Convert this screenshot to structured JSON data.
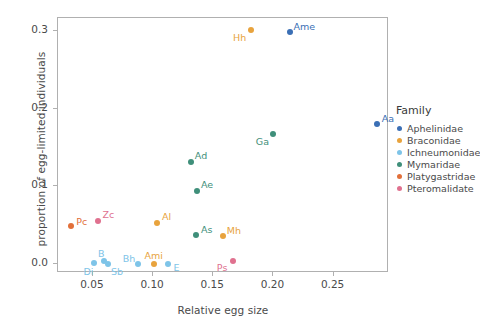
{
  "chart_data": {
    "type": "scatter",
    "title": "",
    "xlabel": "Relative egg size",
    "ylabel": "proportion of egg-limited individuals",
    "xlim": [
      0.021,
      0.296
    ],
    "ylim": [
      -0.012,
      0.317
    ],
    "xticks": [
      "0.05",
      "0.10",
      "0.15",
      "0.20",
      "0.25"
    ],
    "xtick_values": [
      0.05,
      0.1,
      0.15,
      0.2,
      0.25
    ],
    "yticks": [
      "0.0",
      "0.1",
      "0.2",
      "0.3"
    ],
    "ytick_values": [
      0.0,
      0.1,
      0.2,
      0.3
    ],
    "grid": false,
    "legend_position": "right",
    "legend_title": "Family",
    "series": [
      {
        "name": "Aphelinidae",
        "color": "#3b6fb5",
        "points": [
          {
            "label": "Ame",
            "x": 0.214,
            "y": 0.299,
            "label_dx": 14,
            "label_dy": -6
          },
          {
            "label": "Aa",
            "x": 0.286,
            "y": 0.18,
            "label_dx": 11,
            "label_dy": -6
          }
        ]
      },
      {
        "name": "Braconidae",
        "color": "#e8a33d",
        "points": [
          {
            "label": "Hh",
            "x": 0.181,
            "y": 0.302,
            "label_dx": -11,
            "label_dy": 7
          },
          {
            "label": "Al",
            "x": 0.103,
            "y": 0.052,
            "label_dx": 10,
            "label_dy": -7
          },
          {
            "label": "Mh",
            "x": 0.158,
            "y": 0.036,
            "label_dx": 11,
            "label_dy": -6
          },
          {
            "label": "Ami",
            "x": 0.1005,
            "y": 0.0,
            "label_dx": 0,
            "label_dy": -9
          }
        ]
      },
      {
        "name": "Ichneumonidae",
        "color": "#7ec4e8",
        "points": [
          {
            "label": "Di",
            "x": 0.0505,
            "y": 0.0005,
            "label_dx": -5,
            "label_dy": 8
          },
          {
            "label": "B",
            "x": 0.0595,
            "y": 0.0035,
            "label_dx": -3,
            "label_dy": -8
          },
          {
            "label": "Sb",
            "x": 0.0625,
            "y": -0.0005,
            "label_dx": 9,
            "label_dy": 7
          },
          {
            "label": "Bh",
            "x": 0.0875,
            "y": 0.0,
            "label_dx": -9,
            "label_dy": -6
          },
          {
            "label": "E",
            "x": 0.112,
            "y": 0.0,
            "label_dx": 9,
            "label_dy": 3
          }
        ]
      },
      {
        "name": "Mymaridae",
        "color": "#3f8f7a",
        "points": [
          {
            "label": "Ga",
            "x": 0.2,
            "y": 0.1675,
            "label_dx": -11,
            "label_dy": 7
          },
          {
            "label": "Ad",
            "x": 0.1315,
            "y": 0.1315,
            "label_dx": 10,
            "label_dy": -7
          },
          {
            "label": "Ae",
            "x": 0.1365,
            "y": 0.0935,
            "label_dx": 10,
            "label_dy": -7
          },
          {
            "label": "As",
            "x": 0.1355,
            "y": 0.0365,
            "label_dx": 11,
            "label_dy": -6
          }
        ]
      },
      {
        "name": "Platygastridae",
        "color": "#e2703a",
        "points": [
          {
            "label": "Pc",
            "x": 0.0315,
            "y": 0.0485,
            "label_dx": 11,
            "label_dy": -5
          }
        ]
      },
      {
        "name": "Pteromalidate",
        "color": "#e0718f",
        "points": [
          {
            "label": "Zc",
            "x": 0.0545,
            "y": 0.0555,
            "label_dx": 10,
            "label_dy": -7
          },
          {
            "label": "Ps",
            "x": 0.1665,
            "y": 0.0035,
            "label_dx": -11,
            "label_dy": 6
          }
        ]
      }
    ]
  },
  "legend": {
    "title": "Family",
    "entries": [
      {
        "label": "Aphelinidae",
        "color": "#3b6fb5"
      },
      {
        "label": "Braconidae",
        "color": "#e8a33d"
      },
      {
        "label": "Ichneumonidae",
        "color": "#7ec4e8"
      },
      {
        "label": "Mymaridae",
        "color": "#3f8f7a"
      },
      {
        "label": "Platygastridae",
        "color": "#e2703a"
      },
      {
        "label": "Pteromalidate",
        "color": "#e0718f"
      }
    ]
  }
}
